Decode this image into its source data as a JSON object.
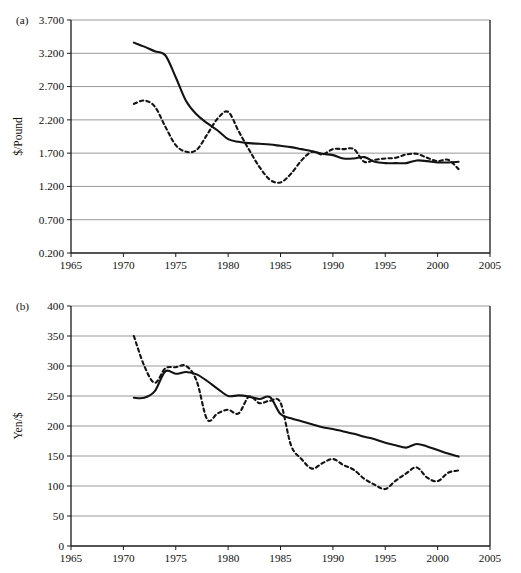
{
  "figure": {
    "width": 521,
    "height": 573,
    "background": "#ffffff",
    "line_color": "#131313",
    "grid_color": "#8d8d8d",
    "axis_color": "#1a1a1a"
  },
  "chart_data": [
    {
      "type": "line",
      "panel_label": "(a)",
      "title": "",
      "xlabel": "",
      "ylabel": "$/Pound",
      "xlim": [
        1965,
        2005
      ],
      "ylim": [
        0.2,
        3.7
      ],
      "xticks": [
        1965,
        1970,
        1975,
        1980,
        1985,
        1990,
        1995,
        2000,
        2005
      ],
      "xtick_labels": [
        "1965",
        "1970",
        "1975",
        "1980",
        "1985",
        "1990",
        "1995",
        "2000",
        "2005"
      ],
      "yticks": [
        0.2,
        0.7,
        1.2,
        1.7,
        2.2,
        2.7,
        3.2,
        3.7
      ],
      "ytick_labels": [
        "0.200",
        "0.700",
        "1.200",
        "1.700",
        "2.200",
        "2.700",
        "3.200",
        "3.700"
      ],
      "grid": "horizontal",
      "legend": "none",
      "series": [
        {
          "name": "solid-series",
          "style": "solid",
          "x": [
            1971,
            1972,
            1973,
            1974,
            1975,
            1976,
            1977,
            1978,
            1979,
            1980,
            1981,
            1982,
            1983,
            1984,
            1985,
            1986,
            1987,
            1988,
            1989,
            1990,
            1991,
            1992,
            1993,
            1994,
            1995,
            1996,
            1997,
            1998,
            1999,
            2000,
            2001,
            2002
          ],
          "values": [
            3.36,
            3.3,
            3.23,
            3.17,
            2.84,
            2.48,
            2.28,
            2.15,
            2.04,
            1.91,
            1.87,
            1.85,
            1.84,
            1.83,
            1.81,
            1.79,
            1.76,
            1.73,
            1.69,
            1.67,
            1.62,
            1.62,
            1.64,
            1.57,
            1.55,
            1.55,
            1.55,
            1.59,
            1.58,
            1.56,
            1.56,
            1.57
          ]
        },
        {
          "name": "dashed-series",
          "style": "dashed",
          "x": [
            1971,
            1972,
            1973,
            1974,
            1975,
            1976,
            1977,
            1978,
            1979,
            1980,
            1981,
            1982,
            1983,
            1984,
            1985,
            1986,
            1987,
            1988,
            1989,
            1990,
            1991,
            1992,
            1993,
            1994,
            1995,
            1996,
            1997,
            1998,
            1999,
            2000,
            2001,
            2002
          ],
          "values": [
            2.44,
            2.49,
            2.4,
            2.1,
            1.82,
            1.72,
            1.75,
            1.98,
            2.22,
            2.32,
            2.03,
            1.75,
            1.49,
            1.3,
            1.26,
            1.39,
            1.59,
            1.72,
            1.68,
            1.76,
            1.76,
            1.76,
            1.57,
            1.6,
            1.62,
            1.63,
            1.68,
            1.69,
            1.63,
            1.58,
            1.6,
            1.46
          ]
        }
      ]
    },
    {
      "type": "line",
      "panel_label": "(b)",
      "title": "",
      "xlabel": "",
      "ylabel": "Yen/$",
      "xlim": [
        1965,
        2005
      ],
      "ylim": [
        0,
        400
      ],
      "xticks": [
        1965,
        1970,
        1975,
        1980,
        1985,
        1990,
        1995,
        2000,
        2005
      ],
      "xtick_labels": [
        "1965",
        "1970",
        "1975",
        "1980",
        "1985",
        "1990",
        "1995",
        "2000",
        "2005"
      ],
      "yticks": [
        0,
        50,
        100,
        150,
        200,
        250,
        300,
        350,
        400
      ],
      "ytick_labels": [
        "0",
        "50",
        "100",
        "150",
        "200",
        "250",
        "300",
        "350",
        "400"
      ],
      "grid": "horizontal",
      "legend": "none",
      "series": [
        {
          "name": "solid-series",
          "style": "solid",
          "x": [
            1971,
            1972,
            1973,
            1974,
            1975,
            1976,
            1977,
            1978,
            1979,
            1980,
            1981,
            1982,
            1983,
            1984,
            1985,
            1986,
            1987,
            1988,
            1989,
            1990,
            1991,
            1992,
            1993,
            1994,
            1995,
            1996,
            1997,
            1998,
            1999,
            2000,
            2001,
            2002
          ],
          "values": [
            247,
            247,
            258,
            291,
            287,
            290,
            286,
            275,
            262,
            250,
            251,
            249,
            245,
            248,
            220,
            213,
            208,
            203,
            198,
            195,
            191,
            187,
            182,
            178,
            172,
            168,
            164,
            170,
            166,
            160,
            154,
            149
          ]
        },
        {
          "name": "dashed-series",
          "style": "dashed",
          "x": [
            1971,
            1972,
            1973,
            1974,
            1975,
            1976,
            1977,
            1978,
            1979,
            1980,
            1981,
            1982,
            1983,
            1984,
            1985,
            1986,
            1987,
            1988,
            1989,
            1990,
            1991,
            1992,
            1993,
            1994,
            1995,
            1996,
            1997,
            1998,
            1999,
            2000,
            2001,
            2002
          ],
          "values": [
            350,
            300,
            272,
            296,
            298,
            300,
            275,
            211,
            221,
            227,
            221,
            249,
            238,
            242,
            239,
            168,
            145,
            129,
            138,
            145,
            135,
            127,
            112,
            102,
            95,
            109,
            121,
            131,
            114,
            108,
            122,
            126
          ]
        }
      ]
    }
  ]
}
